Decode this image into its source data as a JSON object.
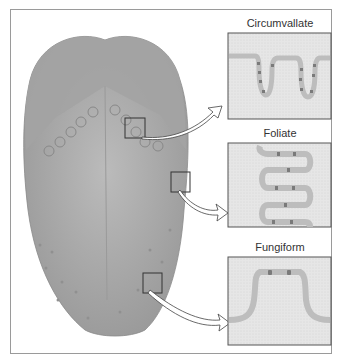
{
  "diagram": {
    "panels": [
      {
        "label": "Circumvallate"
      },
      {
        "label": "Foliate"
      },
      {
        "label": "Fungiform"
      }
    ]
  },
  "colors": {
    "tongue": "#a9a9a9",
    "tongue_back": "#9c9c9c",
    "epithelium": "#bdbdbd",
    "tissue": "#e4e4e4",
    "taste_bud": "#7a7a7a",
    "border": "#555555"
  }
}
